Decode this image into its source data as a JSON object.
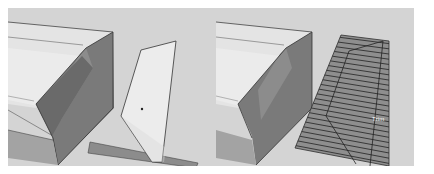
{
  "viewports": [
    {
      "id": "left",
      "description": "3D model view: building with sloped roof edge and a separate polygonal face standing upright near a ground strip",
      "selected_face": "polygon",
      "colors": {
        "background": "#d4d4d4",
        "roof_top": "#e6e6e6",
        "wall_dark": "#6e6e6e",
        "wall_mid": "#8a8a8a",
        "brick": "#a9a9a9",
        "polygon_face": "#e9e9e9",
        "ground_strip": "#8c8c8c",
        "edge": "#333333"
      }
    },
    {
      "id": "right",
      "description": "Same 3D model view with the polygon face laid flat and subdivided by many parallel lines (hatched surface)",
      "hatch_line_count": 24,
      "cursor_label": "Trim",
      "colors": {
        "background": "#d4d4d4",
        "hatched_surface": "#8e8e8e",
        "hatch_line": "#2f2f2f"
      }
    }
  ]
}
